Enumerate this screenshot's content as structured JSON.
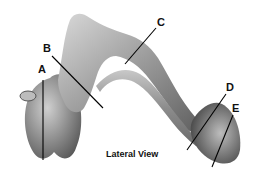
{
  "diagram": {
    "caption": "Lateral View",
    "labels": [
      {
        "id": "A",
        "text": "A"
      },
      {
        "id": "B",
        "text": "B"
      },
      {
        "id": "C",
        "text": "C"
      },
      {
        "id": "D",
        "text": "D"
      },
      {
        "id": "E",
        "text": "E"
      }
    ]
  }
}
